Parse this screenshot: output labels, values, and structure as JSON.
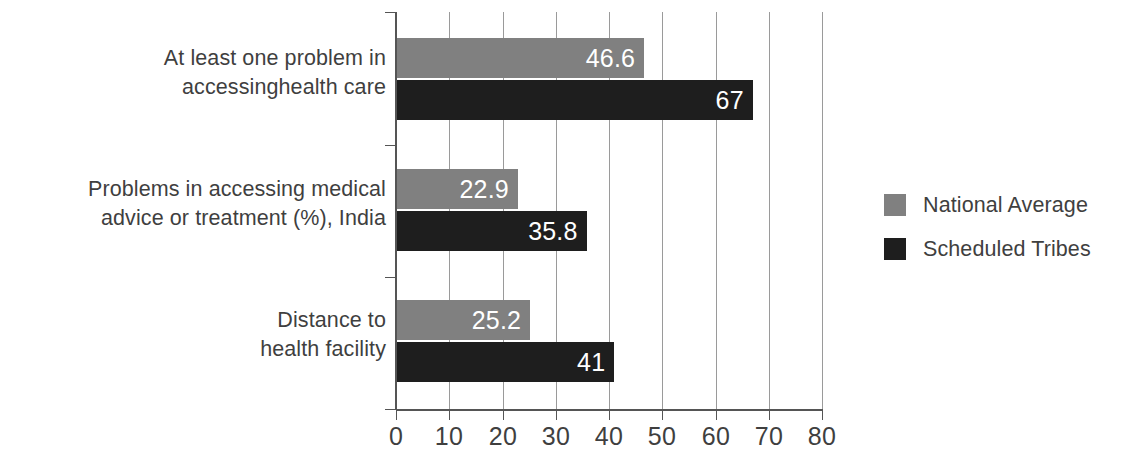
{
  "chart_data": {
    "type": "bar",
    "orientation": "horizontal",
    "title": "",
    "xlabel": "",
    "ylabel": "",
    "xlim": [
      0,
      80
    ],
    "xticks": [
      0,
      10,
      20,
      30,
      40,
      50,
      60,
      70,
      80
    ],
    "xtick_labels": [
      "0",
      "10",
      "20",
      "30",
      "40",
      "50",
      "60",
      "70",
      "80"
    ],
    "grid": "vertical",
    "legend_position": "right",
    "categories": [
      "At least one problem in\naccessinghealth care",
      "Problems in accessing medical\nadvice or treatment (%), India",
      "Distance to\nhealth facility"
    ],
    "series": [
      {
        "name": "National Average",
        "color": "#808080",
        "values": [
          46.6,
          22.9,
          25.2
        ],
        "value_labels": [
          "46.6",
          "22.9",
          "25.2"
        ]
      },
      {
        "name": "Scheduled Tribes",
        "color": "#1e1e1e",
        "values": [
          67,
          35.8,
          41
        ],
        "value_labels": [
          "67",
          "35.8",
          "41"
        ]
      }
    ]
  },
  "legend": {
    "items": [
      {
        "label": "National Average",
        "color": "#808080"
      },
      {
        "label": "Scheduled Tribes",
        "color": "#1e1e1e"
      }
    ]
  },
  "axis": {
    "tick_labels": [
      "0",
      "10",
      "20",
      "30",
      "40",
      "50",
      "60",
      "70",
      "80"
    ]
  },
  "colors": {
    "national_average": "#808080",
    "scheduled_tribes": "#1e1e1e",
    "text": "#3f3f3f",
    "axis": "#555555",
    "gridline": "#9a9a9a",
    "background": "#ffffff",
    "value_label": "#ffffff"
  }
}
